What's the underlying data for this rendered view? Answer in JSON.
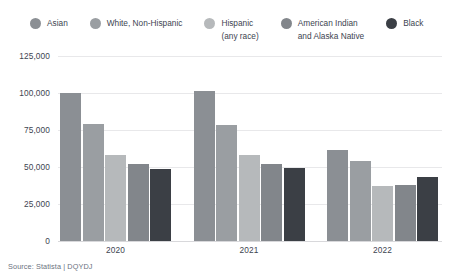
{
  "legend": {
    "items": [
      {
        "label_line1": "Asian",
        "label_line2": "",
        "color": "#8b8f94"
      },
      {
        "label_line1": "White, Non-Hispanic",
        "label_line2": "",
        "color": "#9a9ea2"
      },
      {
        "label_line1": "Hispanic",
        "label_line2": "(any race)",
        "color": "#b6b9bb"
      },
      {
        "label_line1": "American Indian",
        "label_line2": "and Alaska Native",
        "color": "#82868b"
      },
      {
        "label_line1": "Black",
        "label_line2": "",
        "color": "#3b3f45"
      }
    ]
  },
  "source": {
    "text": "Source: Statista | DQYDJ"
  },
  "chart_data": {
    "type": "bar",
    "title": "",
    "subtitle": "",
    "xlabel": "",
    "ylabel": "",
    "categories": [
      "2020",
      "2021",
      "2022"
    ],
    "ylim": [
      0,
      125000
    ],
    "yticks": [
      0,
      25000,
      50000,
      75000,
      100000,
      125000
    ],
    "ytick_labels": [
      "0",
      "25,000",
      "50,000",
      "75,000",
      "100,000",
      "125,000"
    ],
    "grid": true,
    "legend_position": "top",
    "series": [
      {
        "name": "Asian",
        "color": "#8b8f94",
        "values": [
          99800,
          101200,
          61300
        ]
      },
      {
        "name": "White, Non-Hispanic",
        "color": "#9a9ea2",
        "values": [
          79100,
          78600,
          54000
        ]
      },
      {
        "name": "Hispanic (any race)",
        "color": "#b6b9bb",
        "values": [
          58000,
          57900,
          37000
        ]
      },
      {
        "name": "American Indian and Alaska Native",
        "color": "#82868b",
        "values": [
          51800,
          52100,
          37800
        ]
      },
      {
        "name": "Black",
        "color": "#3b3f45",
        "values": [
          48500,
          49200,
          43200
        ]
      }
    ]
  }
}
